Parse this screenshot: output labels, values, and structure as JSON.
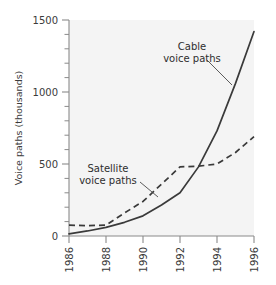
{
  "chart_data": {
    "type": "line",
    "title": "",
    "subtitle": "",
    "xlabel": "",
    "ylabel": "Voice paths (thousands)",
    "x": [
      1986,
      1987,
      1988,
      1989,
      1990,
      1991,
      1992,
      1993,
      1994,
      1995,
      1996
    ],
    "xlim": [
      1986,
      1996
    ],
    "ylim": [
      0,
      1500
    ],
    "xticks": [
      1986,
      1988,
      1990,
      1992,
      1994,
      1996
    ],
    "xticklabels": [
      "1986",
      "1988",
      "1990",
      "1992",
      "1994",
      "1996"
    ],
    "yticks": [
      0,
      500,
      1000,
      1500
    ],
    "yticklabels": [
      "0",
      "500",
      "1000",
      "1500"
    ],
    "y_minor_tick_step": 100,
    "grid": false,
    "legend": "annotations",
    "series": [
      {
        "name": "Cable voice paths",
        "style": "solid",
        "values": [
          15,
          35,
          60,
          95,
          140,
          215,
          300,
          480,
          730,
          1060,
          1420
        ]
      },
      {
        "name": "Satellite voice paths",
        "style": "dashed",
        "values": [
          75,
          72,
          75,
          160,
          240,
          360,
          480,
          485,
          500,
          580,
          690
        ]
      }
    ],
    "annotations": [
      {
        "text_line1": "Cable",
        "text_line2": "voice paths",
        "target_series": "Cable voice paths",
        "label_x": 192,
        "label_y": 50,
        "leader_from_x": 207,
        "leader_from_y": 60,
        "leader_to_x": 232,
        "leader_to_y": 85
      },
      {
        "text_line1": "Satellite",
        "text_line2": "voice paths",
        "target_series": "Satellite voice paths",
        "label_x": 108,
        "label_y": 172,
        "leader_from_x": 140,
        "leader_from_y": 182,
        "leader_to_x": 158,
        "leader_to_y": 197
      }
    ]
  },
  "axes": {
    "y_axis_title": "Voice paths (thousands)"
  }
}
